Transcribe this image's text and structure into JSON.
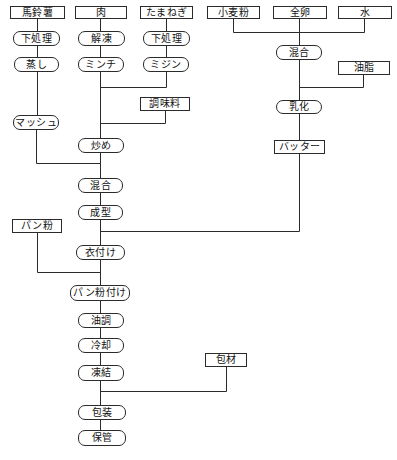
{
  "colors": {
    "background": "#ffffff",
    "line": "#2b2b2b",
    "text": "#111111"
  },
  "flowchart": {
    "description": "food-production-process-flow",
    "nodes": [
      {
        "id": "potato",
        "label": "馬鈴薯",
        "shape": "rectangle"
      },
      {
        "id": "meat",
        "label": "肉",
        "shape": "rectangle"
      },
      {
        "id": "onion",
        "label": "たまねぎ",
        "shape": "rectangle"
      },
      {
        "id": "flour",
        "label": "小麦粉",
        "shape": "rectangle"
      },
      {
        "id": "egg",
        "label": "全卵",
        "shape": "rectangle"
      },
      {
        "id": "water",
        "label": "水",
        "shape": "rectangle"
      },
      {
        "id": "prep-potato",
        "label": "下処理",
        "shape": "rounded"
      },
      {
        "id": "thaw",
        "label": "解凍",
        "shape": "rounded"
      },
      {
        "id": "prep-onion",
        "label": "下処理",
        "shape": "rounded"
      },
      {
        "id": "batter-mix",
        "label": "混合",
        "shape": "rounded"
      },
      {
        "id": "steam",
        "label": "蒸し",
        "shape": "rounded"
      },
      {
        "id": "mince",
        "label": "ミンチ",
        "shape": "rounded"
      },
      {
        "id": "chop",
        "label": "ミジン",
        "shape": "rounded"
      },
      {
        "id": "fat",
        "label": "油脂",
        "shape": "rectangle"
      },
      {
        "id": "seasoning",
        "label": "調味料",
        "shape": "rectangle"
      },
      {
        "id": "emulsify",
        "label": "乳化",
        "shape": "rounded"
      },
      {
        "id": "mash",
        "label": "マッシュ",
        "shape": "rounded"
      },
      {
        "id": "stir-fry",
        "label": "炒め",
        "shape": "rounded"
      },
      {
        "id": "batter",
        "label": "バッター",
        "shape": "rectangle"
      },
      {
        "id": "mix",
        "label": "混合",
        "shape": "rounded"
      },
      {
        "id": "mold",
        "label": "成型",
        "shape": "rounded"
      },
      {
        "id": "breadcrumbs",
        "label": "パン粉",
        "shape": "rectangle"
      },
      {
        "id": "coat",
        "label": "衣付け",
        "shape": "rounded"
      },
      {
        "id": "breading",
        "label": "パン粉付け",
        "shape": "rounded"
      },
      {
        "id": "fry",
        "label": "油調",
        "shape": "rounded"
      },
      {
        "id": "cool",
        "label": "冷却",
        "shape": "rounded"
      },
      {
        "id": "freeze",
        "label": "凍結",
        "shape": "rounded"
      },
      {
        "id": "packaging-material",
        "label": "包材",
        "shape": "rectangle"
      },
      {
        "id": "package",
        "label": "包装",
        "shape": "rounded"
      },
      {
        "id": "store",
        "label": "保管",
        "shape": "rounded"
      }
    ],
    "edges": [
      {
        "from": "potato",
        "to": "prep-potato"
      },
      {
        "from": "prep-potato",
        "to": "steam"
      },
      {
        "from": "steam",
        "to": "mash"
      },
      {
        "from": "mash",
        "to": "mix"
      },
      {
        "from": "meat",
        "to": "thaw"
      },
      {
        "from": "thaw",
        "to": "mince"
      },
      {
        "from": "mince",
        "to": "stir-fry"
      },
      {
        "from": "onion",
        "to": "prep-onion"
      },
      {
        "from": "prep-onion",
        "to": "chop"
      },
      {
        "from": "chop",
        "to": "stir-fry"
      },
      {
        "from": "seasoning",
        "to": "stir-fry"
      },
      {
        "from": "stir-fry",
        "to": "mix"
      },
      {
        "from": "mix",
        "to": "mold"
      },
      {
        "from": "mold",
        "to": "coat"
      },
      {
        "from": "flour",
        "to": "batter-mix"
      },
      {
        "from": "egg",
        "to": "batter-mix"
      },
      {
        "from": "water",
        "to": "batter-mix"
      },
      {
        "from": "batter-mix",
        "to": "emulsify"
      },
      {
        "from": "fat",
        "to": "emulsify"
      },
      {
        "from": "emulsify",
        "to": "batter"
      },
      {
        "from": "batter",
        "to": "coat"
      },
      {
        "from": "coat",
        "to": "breading"
      },
      {
        "from": "breadcrumbs",
        "to": "breading"
      },
      {
        "from": "breading",
        "to": "fry"
      },
      {
        "from": "fry",
        "to": "cool"
      },
      {
        "from": "cool",
        "to": "freeze"
      },
      {
        "from": "freeze",
        "to": "package"
      },
      {
        "from": "packaging-material",
        "to": "package"
      },
      {
        "from": "package",
        "to": "store"
      }
    ]
  }
}
